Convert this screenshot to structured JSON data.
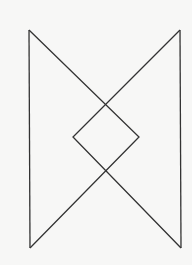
{
  "figure": {
    "stroke_color": "#333333",
    "background_color": "#f7f7f6",
    "stroke_width": 1.3,
    "vertices": {
      "top_left": [
        29,
        30
      ],
      "top_right": [
        180,
        30
      ],
      "bottom_left": [
        30,
        248
      ],
      "bottom_right": [
        181,
        248
      ],
      "top_crossing": [
        105,
        105
      ],
      "bottom_crossing": [
        105,
        171
      ],
      "diamond_left": [
        73,
        137
      ],
      "diamond_right": [
        139,
        137
      ]
    },
    "segments": [
      {
        "name": "left-side",
        "points": "29,30 30,248"
      },
      {
        "name": "right-side",
        "points": "180,30 181,248"
      },
      {
        "name": "stroke-a",
        "points": "29,30 139,137 30,248"
      },
      {
        "name": "stroke-b",
        "points": "180,30 73,137 181,248"
      }
    ]
  }
}
